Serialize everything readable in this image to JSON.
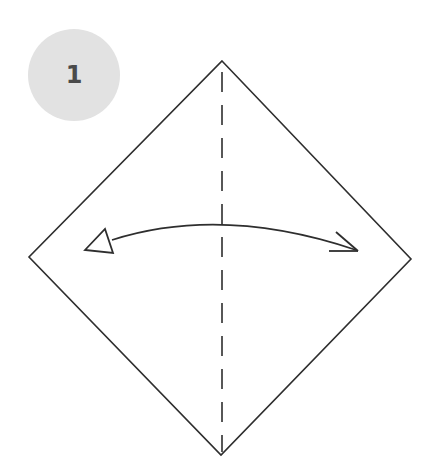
{
  "step": {
    "number": "1"
  },
  "diagram": {
    "shape": "square-paper-diamond",
    "vertices": {
      "top": [
        222,
        61
      ],
      "right": [
        411,
        259
      ],
      "bottom": [
        221,
        455
      ],
      "left": [
        29,
        257
      ]
    },
    "fold_line": {
      "style": "dashed-valley-fold",
      "x": 222,
      "y_start": 64,
      "y_end": 452
    },
    "arrow": {
      "type": "double-headed-curved",
      "meaning": "fold-and-unfold",
      "from": [
        86,
        250
      ],
      "to": [
        358,
        251
      ],
      "peak_y": 224
    },
    "colors": {
      "line": "#2e2e2e",
      "badge_bg": "#e2e2e2",
      "badge_text": "#4a4a4a"
    }
  }
}
